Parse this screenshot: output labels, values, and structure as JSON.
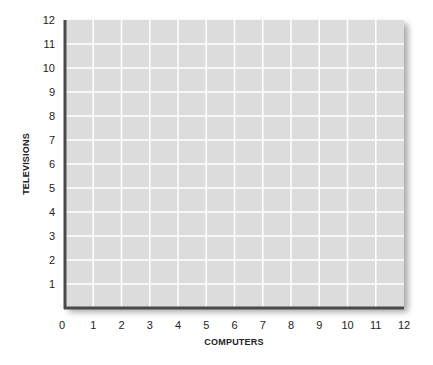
{
  "chart_data": {
    "type": "scatter",
    "title": "",
    "xlabel": "COMPUTERS",
    "ylabel": "TELEVISIONS",
    "xlim": [
      0,
      12
    ],
    "ylim": [
      0,
      12
    ],
    "x_ticks": [
      "0",
      "1",
      "2",
      "3",
      "4",
      "5",
      "6",
      "7",
      "8",
      "9",
      "10",
      "11",
      "12"
    ],
    "y_ticks": [
      "1",
      "2",
      "3",
      "4",
      "5",
      "6",
      "7",
      "8",
      "9",
      "10",
      "11",
      "12"
    ],
    "grid": true,
    "series": [],
    "legend": null
  },
  "colors": {
    "plot_background": "#dcdcdc",
    "gridline": "#ffffff",
    "axis_line": "#4a4a4a"
  }
}
